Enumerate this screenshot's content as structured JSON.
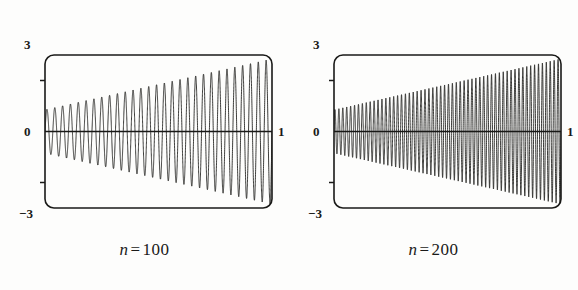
{
  "figure": {
    "background_color": "#fdfdfc",
    "ink_color": "#1a1a18"
  },
  "chart_data": [
    {
      "type": "line",
      "title": "n = 100",
      "caption_variable": "n",
      "caption_equals": "=",
      "caption_value": "100",
      "xlabel": "",
      "ylabel": "",
      "xlim": [
        0,
        1
      ],
      "ylim": [
        -3,
        3
      ],
      "x_tick_labels": [
        "0",
        "1"
      ],
      "y_tick_labels": [
        "3",
        "-3"
      ],
      "y_minor_ticks": [
        2,
        -2
      ],
      "grid": false,
      "legend": "none",
      "description": "Rapidly oscillating curve with a linearly growing amplitude envelope; amplitude rises from about 0.85 at x=0 to about 2.85 at x=1, roughly 29 full oscillations across the interval.",
      "envelope_start": 0.85,
      "envelope_end": 2.85,
      "oscillation_count": 29,
      "zero_line": 0,
      "frame": {
        "x0": 45,
        "y0": 55,
        "x1": 272,
        "y1": 208,
        "corner_radius": 9
      }
    },
    {
      "type": "line",
      "title": "n = 200",
      "caption_variable": "n",
      "caption_equals": "=",
      "caption_value": "200",
      "xlabel": "",
      "ylabel": "",
      "xlim": [
        0,
        1
      ],
      "ylim": [
        -3,
        3
      ],
      "x_tick_labels": [
        "0",
        "1"
      ],
      "y_tick_labels": [
        "3",
        "-3"
      ],
      "y_minor_ticks": [
        2,
        -2
      ],
      "grid": false,
      "legend": "none",
      "description": "Rapidly oscillating curve with a linearly growing amplitude envelope; amplitude rises from about 0.85 at x=0 to about 2.85 at x=1, roughly 58 full oscillations across the interval.",
      "envelope_start": 0.85,
      "envelope_end": 2.85,
      "oscillation_count": 58,
      "zero_line": 0,
      "frame": {
        "x0": 45,
        "y0": 55,
        "x1": 272,
        "y1": 208,
        "corner_radius": 9
      }
    }
  ],
  "panels": [
    {
      "labels": {
        "top": "3",
        "zero": "0",
        "bottom": "−3",
        "right": "1"
      },
      "caption": {
        "variable": "n",
        "equals": "=",
        "value": "100"
      }
    },
    {
      "labels": {
        "top": "3",
        "zero": "0",
        "bottom": "−3",
        "right": "1"
      },
      "caption": {
        "variable": "n",
        "equals": "=",
        "value": "200"
      }
    }
  ]
}
